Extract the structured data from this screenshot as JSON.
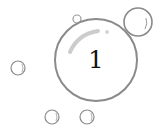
{
  "badge": {
    "number": "1"
  },
  "colors": {
    "bubble_stroke": "#8a8a8a",
    "bubble_highlight": "#c8c8c8",
    "number": "#111111",
    "background": "#ffffff"
  },
  "bubbles": [
    {
      "name": "main-bubble",
      "cx": 96,
      "cy": 60,
      "r": 41
    },
    {
      "name": "top-right-bubble",
      "cx": 138,
      "cy": 22,
      "r": 14
    },
    {
      "name": "top-small-bubble",
      "cx": 77,
      "cy": 19,
      "r": 4
    },
    {
      "name": "left-bubble",
      "cx": 18,
      "cy": 68,
      "r": 7
    },
    {
      "name": "bottom-left-bubble",
      "cx": 52,
      "cy": 117,
      "r": 7
    },
    {
      "name": "bottom-right-bubble",
      "cx": 87,
      "cy": 117,
      "r": 7
    }
  ]
}
